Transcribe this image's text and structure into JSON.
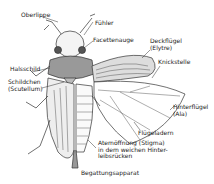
{
  "diagram": {
    "labels": {
      "oberlippe": "Oberlippe",
      "fuehler": "Fühler",
      "facettenauge": "Facettenauge",
      "deckfluegel_1": "Deckflügel",
      "deckfluegel_2": "(Elytre)",
      "knickstelle": "Knickstelle",
      "halsschild": "Halsschild",
      "schildchen_1": "Schildchen",
      "schildchen_2": "(Scutellum)",
      "hinterfluegel_1": "Hinterflügel",
      "hinterfluegel_2": "(Ala)",
      "fluegeladern": "Flügeladern",
      "atem_1": "Atemöffnung (Stigma)",
      "atem_2": "in dem weichen Hinter-",
      "atem_3": "leibsrücken",
      "begattung": "Begattungsapparat"
    }
  }
}
